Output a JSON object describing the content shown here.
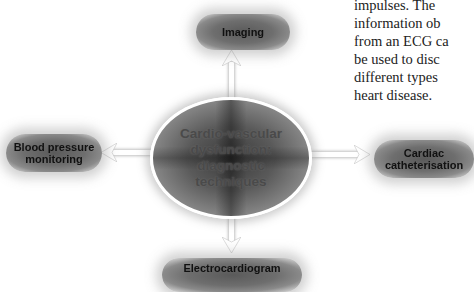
{
  "diagram": {
    "center": {
      "lines": [
        "Cardio-vascular",
        "dysfunction:",
        "diagnostic",
        "techniques"
      ]
    },
    "nodes": {
      "top": {
        "label": "Imaging"
      },
      "left": {
        "lines": [
          "Blood pressure",
          "monitoring"
        ]
      },
      "right": {
        "lines": [
          "Cardiac",
          "catheterisation"
        ]
      },
      "bottom": {
        "label": "Electrocardiogram"
      }
    },
    "arrows": [
      "center-to-top",
      "center-to-left",
      "center-to-right",
      "center-to-bottom"
    ]
  },
  "prose": {
    "lines": [
      "impulses. The",
      "information ob",
      "from an ECG ca",
      "be used to disc",
      "different types",
      "heart disease."
    ]
  },
  "colors": {
    "box_fill": "#5a5a5a",
    "arrow": "#ffffff",
    "ellipse_border": "#ffffff",
    "text": "#111111"
  }
}
